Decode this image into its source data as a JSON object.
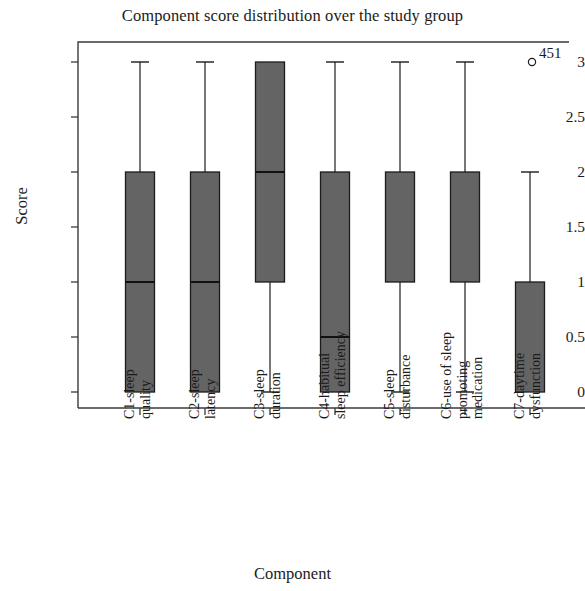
{
  "chart_data": {
    "type": "box",
    "title": "Component score distribution over the study group",
    "xlabel": "Component",
    "ylabel": "Score",
    "ylim": [
      0,
      3.15
    ],
    "y_ticks": [
      0,
      0.5,
      1,
      1.5,
      2,
      2.5,
      3
    ],
    "y_tick_labels": [
      "0",
      "0.5",
      "1",
      "1.5",
      "2",
      "2.5",
      "3"
    ],
    "grid": false,
    "legend": "none",
    "box_fill_color": "#646464",
    "box_edge_color": "#1b1b1b",
    "categories": [
      "C1-sleep\nquality",
      "C2-sleep\nlatency",
      "C3-sleep\nduration",
      "C4-habitual\nsleep efficiency",
      "C5-sleep\ndisturbance",
      "C6-use of sleep\npromoting\nmedication",
      "C7-daytime\ndysfunction"
    ],
    "boxes": [
      {
        "label": "C1-sleep quality",
        "whisker_low": 0,
        "q1": 0,
        "median": 1,
        "q3": 2,
        "whisker_high": 3,
        "has_low_cap": false,
        "has_high_cap": true
      },
      {
        "label": "C2-sleep latency",
        "whisker_low": 0,
        "q1": 0,
        "median": 1,
        "q3": 2,
        "whisker_high": 3,
        "has_low_cap": false,
        "has_high_cap": true
      },
      {
        "label": "C3-sleep duration",
        "whisker_low": 0,
        "q1": 1,
        "median": 2,
        "q3": 3,
        "whisker_high": 3,
        "has_low_cap": true,
        "has_high_cap": false
      },
      {
        "label": "C4-habitual sleep efficiency",
        "whisker_low": 0,
        "q1": 0,
        "median": 0.5,
        "q3": 2,
        "whisker_high": 3,
        "has_low_cap": false,
        "has_high_cap": true
      },
      {
        "label": "C5-sleep disturbance",
        "whisker_low": 0,
        "q1": 1,
        "median": 1,
        "q3": 2,
        "whisker_high": 3,
        "has_low_cap": true,
        "has_high_cap": true
      },
      {
        "label": "C6-use of sleep promoting medication",
        "whisker_low": 0,
        "q1": 1,
        "median": 1,
        "q3": 2,
        "whisker_high": 3,
        "has_low_cap": true,
        "has_high_cap": true
      },
      {
        "label": "C7-daytime dysfunction",
        "whisker_low": 0,
        "q1": 0,
        "median": 0,
        "q3": 1,
        "whisker_high": 2,
        "has_low_cap": false,
        "has_high_cap": true
      }
    ],
    "outliers": [
      {
        "category_index": 6,
        "value": 3,
        "label": "451",
        "marker": "open-circle"
      }
    ]
  }
}
